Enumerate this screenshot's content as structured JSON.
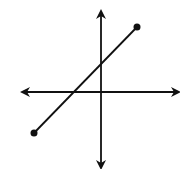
{
  "diagram": {
    "type": "coordinate-plane-line-segment",
    "colors": {
      "stroke": "#111111",
      "background": "#ffffff"
    },
    "axes": {
      "origin": {
        "x": 101,
        "y": 92
      },
      "x_axis": {
        "x1": 22,
        "x2": 179,
        "y": 92,
        "arrows": "both"
      },
      "y_axis": {
        "x": 101,
        "y1": 11,
        "y2": 168,
        "arrows": "both"
      }
    },
    "segment": {
      "start": {
        "x": 34,
        "y": 133
      },
      "end": {
        "x": 137,
        "y": 27
      },
      "endpoints": "closed-dots",
      "slope": "positive"
    }
  }
}
